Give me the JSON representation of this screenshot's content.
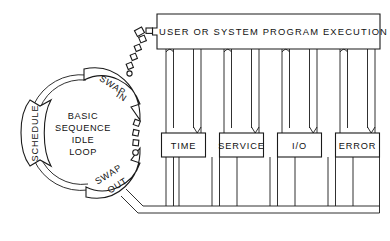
{
  "diagram": {
    "colors": {
      "line": "#1a1a1a",
      "background": "#ffffff",
      "text": "#111111"
    },
    "header": {
      "label": "USER OR SYSTEM PROGRAM EXECUTION"
    },
    "center": {
      "lines": [
        "BASIC",
        "SEQUENCE",
        "IDLE",
        "LOOP"
      ]
    },
    "arcs": [
      {
        "name": "schedule",
        "lines": [
          "SCHEDULE"
        ]
      },
      {
        "name": "swap-in",
        "lines": [
          "SWAP",
          "IN"
        ]
      },
      {
        "name": "swap-out",
        "lines": [
          "SWAP",
          "OUT"
        ]
      }
    ],
    "columns": [
      {
        "name": "time",
        "label": "TIME"
      },
      {
        "name": "service",
        "label": "SERVICE"
      },
      {
        "name": "io",
        "label": "I/O"
      },
      {
        "name": "error",
        "label": "ERROR"
      }
    ]
  }
}
